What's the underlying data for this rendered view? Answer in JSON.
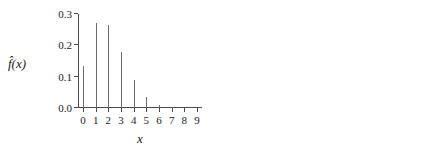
{
  "figure": {
    "background": "#ffffff",
    "ink": "#1a1a1a",
    "axis_color": "#4a4a4a",
    "stem_color": "#5a5a5a",
    "marker_color": "#111111"
  },
  "panels": [
    {
      "id": "left",
      "ylabel": "f̂(x)",
      "xlabel": "x",
      "y_ticks_labeled": true
    },
    {
      "id": "right",
      "ylabel": "",
      "xlabel": "x",
      "y_ticks_labeled": false
    }
  ],
  "chart_data": [
    {
      "type": "bar",
      "title": "",
      "subtitle": "",
      "xlabel": "x",
      "ylabel": "f̂(x)",
      "categories": [
        "0",
        "1",
        "2",
        "3",
        "4",
        "5",
        "6",
        "7",
        "8",
        "9"
      ],
      "x": [
        0,
        1,
        2,
        3,
        4,
        5,
        6,
        7,
        8,
        9
      ],
      "values": [
        0.135,
        0.271,
        0.266,
        0.178,
        0.09,
        0.035,
        0.011,
        0.003,
        0.001,
        0.0
      ],
      "xlim": [
        -0.4,
        9.4
      ],
      "ylim": [
        0.0,
        0.3
      ],
      "y_tick_labels": [
        "0.0",
        "0.1",
        "0.2",
        "0.3"
      ],
      "y_tick_values": [
        0.0,
        0.1,
        0.2,
        0.3
      ],
      "x_tick_labels": [
        "0",
        "1",
        "2",
        "3",
        "4",
        "5",
        "6",
        "7",
        "8",
        "9"
      ],
      "grid": false,
      "legend": null,
      "marker": "none",
      "style": "needle-spike"
    },
    {
      "type": "scatter",
      "title": "",
      "subtitle": "",
      "xlabel": "x",
      "ylabel": "",
      "categories": [
        "0",
        "1",
        "2",
        "3",
        "4",
        "5",
        "6",
        "7",
        "8",
        "9"
      ],
      "x": [
        0,
        1,
        2,
        3,
        4,
        5,
        6,
        7,
        8,
        9
      ],
      "values": [
        0.135,
        0.271,
        0.271,
        0.18,
        0.09,
        0.036,
        0.012,
        0.003,
        0.001,
        0.0
      ],
      "xlim": [
        -0.4,
        9.4
      ],
      "ylim": [
        0.0,
        0.3
      ],
      "y_tick_labels": [
        "",
        "",
        "",
        ""
      ],
      "y_tick_values": [
        0.0,
        0.1,
        0.2,
        0.3
      ],
      "x_tick_labels": [
        "0",
        "1",
        "2",
        "3",
        "4",
        "5",
        "6",
        "7",
        "8",
        "9"
      ],
      "grid": false,
      "legend": null,
      "marker": "filled-circle",
      "style": "stem-with-markers"
    }
  ]
}
